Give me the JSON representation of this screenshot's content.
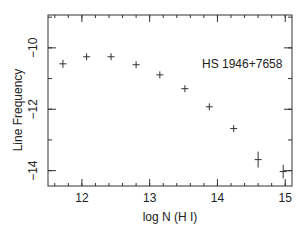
{
  "chart_data": {
    "type": "scatter",
    "title": "",
    "annotation": "HS 1946+7658",
    "xlabel": "log N (H I)",
    "ylabel": "Line Frequency",
    "xlim": [
      11.5,
      15.1
    ],
    "ylim": [
      -14.5,
      -8.93
    ],
    "x_ticks": [
      12,
      13,
      14,
      15
    ],
    "x_tick_labels": [
      "12",
      "13",
      "14",
      "15"
    ],
    "x_minor_step": 0.2,
    "y_ticks": [
      -10,
      -12,
      -14
    ],
    "y_tick_labels": [
      "−10",
      "−12",
      "−14"
    ],
    "y_minor_step": 1,
    "grid": false,
    "legend": null,
    "series": [
      {
        "name": "HS 1946+7658",
        "marker": "cross",
        "x": [
          11.72,
          12.07,
          12.43,
          12.8,
          13.15,
          13.52,
          13.88,
          14.24,
          14.6,
          14.97
        ],
        "y": [
          -10.52,
          -10.29,
          -10.29,
          -10.55,
          -10.88,
          -11.33,
          -11.92,
          -12.63,
          -13.64,
          -14.03
        ],
        "yerr": [
          0.13,
          0.06,
          0.06,
          0.06,
          0.06,
          0.08,
          0.08,
          0.1,
          0.26,
          0.22
        ],
        "xerr": [
          0.07,
          0.07,
          0.07,
          0.07,
          0.07,
          0.07,
          0.07,
          0.07,
          0.07,
          0.07
        ]
      }
    ]
  },
  "labels": {
    "annotation": "HS 1946+7658",
    "xlabel": "log N (H I)",
    "ylabel": "Line Frequency"
  }
}
